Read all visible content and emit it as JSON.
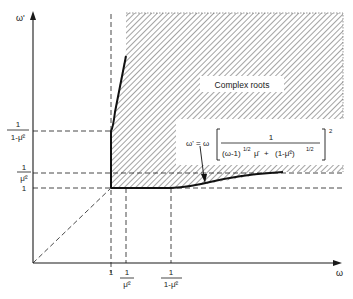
{
  "axes": {
    "x_label": "ω",
    "y_label": "ω'"
  },
  "x_ticks": [
    {
      "id": "one",
      "num": "1",
      "den": ""
    },
    {
      "id": "inv_mu2",
      "num": "1",
      "den": "μ̄²"
    },
    {
      "id": "inv_one_minus_mu2",
      "num": "1",
      "den": "1-μ̄²"
    }
  ],
  "y_ticks": [
    {
      "id": "inv_one_minus_mu2",
      "num": "1",
      "den": "1-μ̄²"
    },
    {
      "id": "inv_mu2",
      "num": "1",
      "den": "μ̄²"
    },
    {
      "id": "one",
      "num": "1",
      "den": ""
    }
  ],
  "region_label": "Complex roots",
  "formula": {
    "lhs": "ω' = ω",
    "numerator": "1",
    "denominator_a": "(ω-1)",
    "exp_a": "1/2",
    "mu": "μ̄",
    "plus": "+",
    "denominator_b": "(1-μ̄²)",
    "exp_b": "1/2",
    "outer_exp": "2"
  },
  "colors": {
    "ink": "#1a1a1a",
    "background": "#ffffff"
  }
}
